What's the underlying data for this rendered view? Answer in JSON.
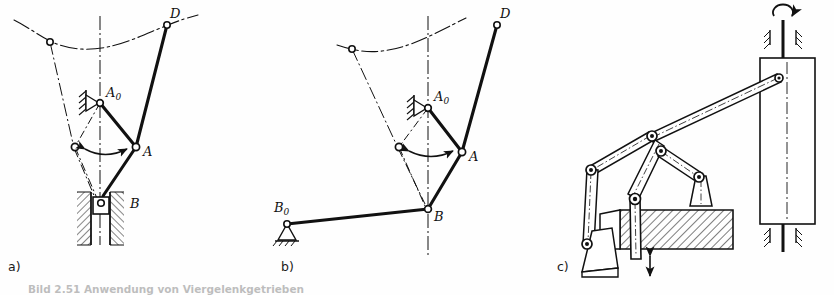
{
  "figure": {
    "type": "engineering-kinematic-diagram",
    "background_color": "#fefefe",
    "line_color": "#111111",
    "panels": [
      {
        "id": "a",
        "label": "a)",
        "description": "Lever mechanism with vertical slider guide at B",
        "points": [
          {
            "name": "A0",
            "label": "A",
            "subscript": "0",
            "kind": "fixed-pivot"
          },
          {
            "name": "A",
            "label": "A",
            "subscript": "",
            "kind": "moving-pivot"
          },
          {
            "name": "B",
            "label": "B",
            "subscript": "",
            "kind": "slider"
          },
          {
            "name": "D",
            "label": "D",
            "subscript": "",
            "kind": "coupler-point"
          }
        ]
      },
      {
        "id": "b",
        "label": "b)",
        "description": "Same mechanism with rocker link B0B replacing the slider",
        "points": [
          {
            "name": "A0",
            "label": "A",
            "subscript": "0",
            "kind": "fixed-pivot"
          },
          {
            "name": "A",
            "label": "A",
            "subscript": "",
            "kind": "moving-pivot"
          },
          {
            "name": "B",
            "label": "B",
            "subscript": "",
            "kind": "moving-pivot"
          },
          {
            "name": "B0",
            "label": "B",
            "subscript": "0",
            "kind": "fixed-pivot"
          },
          {
            "name": "D",
            "label": "D",
            "subscript": "",
            "kind": "coupler-point"
          }
        ]
      },
      {
        "id": "c",
        "label": "c)",
        "description": "Pictorial three-dimensional view of the press linkage with hatched die block, vertical punch rod and driven shaft",
        "points": []
      }
    ]
  },
  "caption": {
    "text": "Bild 2.51  Anwendung von Viergelenkgetrieben",
    "clipped": true
  }
}
